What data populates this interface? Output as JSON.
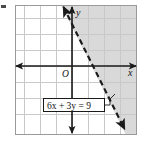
{
  "figure": {
    "kind": "coordinate-plane-inequality-graph",
    "axis_labels": {
      "x": "x",
      "y": "y",
      "origin": "O"
    },
    "equation_label": {
      "text": "6x + 3y = 9",
      "boundary_style": "dashed",
      "has_leader_line": true
    },
    "colors": {
      "grid_line": "#c9c9c9",
      "grid_frame": "#8c8c8c",
      "axis": "#1a1a1a",
      "boundary_line": "#1a1a1a",
      "shading": "#d9d9d9",
      "label_box_fill": "#ffffff",
      "label_box_border": "#1a1a1a",
      "page_background": "#ffffff"
    },
    "grid": {
      "cell_size_px": 16,
      "columns": 8,
      "rows": 8,
      "frame": {
        "left": 15,
        "top": 5,
        "right": 137,
        "bottom": 135
      }
    },
    "axes": {
      "x_axis_y_px": 66,
      "y_axis_x_px": 72,
      "x_axis_arrows": "both",
      "y_axis_arrows": "both"
    },
    "boundary": {
      "from": {
        "x": 62,
        "y": 4
      },
      "to": {
        "x": 126,
        "y": 132
      },
      "dashed": true,
      "arrows": "both",
      "shaded_side": "right"
    },
    "artifact_mark": {
      "x": 1,
      "y": 5,
      "width": 5,
      "height": 3
    }
  }
}
